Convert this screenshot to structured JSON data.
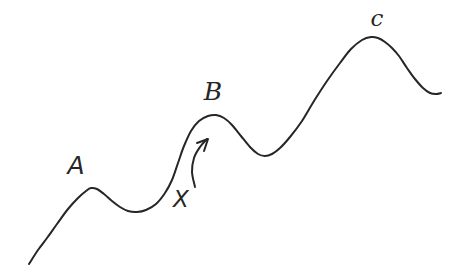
{
  "figure": {
    "background_color": "#ffffff",
    "ink_color": "#262626",
    "stroke_width": 2,
    "labels": [
      {
        "text": "A",
        "x": 76,
        "y": 174,
        "size": 25
      },
      {
        "text": "B",
        "x": 213,
        "y": 100,
        "size": 25
      },
      {
        "text": "c",
        "x": 377,
        "y": 26,
        "size": 23
      },
      {
        "text": "X",
        "x": 181,
        "y": 207,
        "size": 23
      }
    ],
    "curve_points": [
      [
        29,
        264
      ],
      [
        38,
        250
      ],
      [
        47,
        238
      ],
      [
        57,
        224
      ],
      [
        68,
        209
      ],
      [
        78,
        198
      ],
      [
        86,
        191
      ],
      [
        91,
        188
      ],
      [
        97,
        189
      ],
      [
        104,
        194
      ],
      [
        112,
        201
      ],
      [
        120,
        207
      ],
      [
        128,
        211
      ],
      [
        137,
        212
      ],
      [
        146,
        210
      ],
      [
        156,
        204
      ],
      [
        165,
        193
      ],
      [
        172,
        180
      ],
      [
        178,
        163
      ],
      [
        184,
        146
      ],
      [
        191,
        131
      ],
      [
        199,
        121
      ],
      [
        208,
        116
      ],
      [
        216,
        115
      ],
      [
        224,
        118
      ],
      [
        232,
        125
      ],
      [
        241,
        136
      ],
      [
        250,
        147
      ],
      [
        258,
        154
      ],
      [
        265,
        156
      ],
      [
        272,
        154
      ],
      [
        280,
        148
      ],
      [
        290,
        137
      ],
      [
        302,
        121
      ],
      [
        314,
        101
      ],
      [
        327,
        81
      ],
      [
        340,
        63
      ],
      [
        351,
        49
      ],
      [
        362,
        40
      ],
      [
        371,
        37
      ],
      [
        378,
        38
      ],
      [
        385,
        42
      ],
      [
        392,
        48
      ],
      [
        399,
        56
      ],
      [
        407,
        68
      ],
      [
        415,
        79
      ],
      [
        423,
        88
      ],
      [
        430,
        93
      ],
      [
        436,
        94
      ],
      [
        441,
        93
      ]
    ],
    "arrow": {
      "shaft": [
        [
          195,
          187
        ],
        [
          192,
          172
        ],
        [
          194,
          158
        ],
        [
          200,
          147
        ],
        [
          207,
          139
        ]
      ],
      "head": [
        [
          197,
          143
        ],
        [
          208,
          139
        ],
        [
          204,
          151
        ]
      ]
    }
  }
}
